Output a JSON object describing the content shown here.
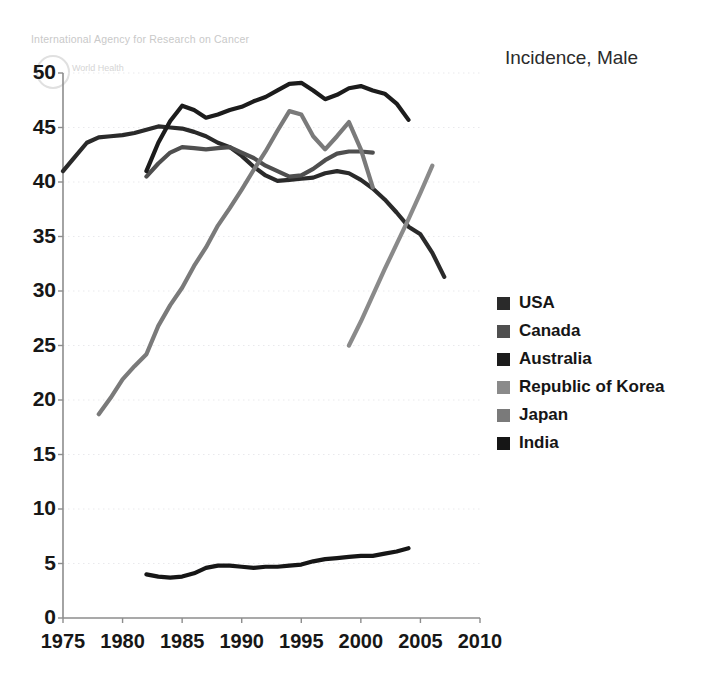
{
  "watermark": {
    "agency": "International Agency for Research on Cancer",
    "org": "World Health"
  },
  "title": "Incidence, Male",
  "legend": {
    "items": [
      {
        "label": "USA",
        "color": "#2a2a2a"
      },
      {
        "label": "Canada",
        "color": "#4f4f4f"
      },
      {
        "label": "Australia",
        "color": "#1c1c1c"
      },
      {
        "label": "Republic of Korea",
        "color": "#8a8a8a"
      },
      {
        "label": "Japan",
        "color": "#7a7a7a"
      },
      {
        "label": "India",
        "color": "#161616"
      }
    ]
  },
  "chart_data": {
    "type": "line",
    "title": "Incidence, Male",
    "xlabel": "",
    "ylabel": "",
    "xlim": [
      1975,
      2010
    ],
    "ylim": [
      0,
      50
    ],
    "xticks": [
      1975,
      1980,
      1985,
      1990,
      1995,
      2000,
      2005,
      2010
    ],
    "yticks": [
      0,
      5,
      10,
      15,
      20,
      25,
      30,
      35,
      40,
      45,
      50
    ],
    "grid": "horizontal-dotted",
    "legend_position": "right",
    "series": [
      {
        "name": "USA",
        "color": "#2a2a2a",
        "x": [
          1975,
          1976,
          1977,
          1978,
          1979,
          1980,
          1981,
          1982,
          1983,
          1984,
          1985,
          1986,
          1987,
          1988,
          1989,
          1990,
          1991,
          1992,
          1993,
          1994,
          1995,
          1996,
          1997,
          1998,
          1999,
          2000,
          2001,
          2002,
          2003,
          2004,
          2005,
          2006,
          2007
        ],
        "y": [
          41.0,
          42.3,
          43.6,
          44.1,
          44.2,
          44.3,
          44.5,
          44.8,
          45.1,
          45.0,
          44.9,
          44.6,
          44.2,
          43.6,
          43.2,
          42.4,
          41.4,
          40.6,
          40.1,
          40.2,
          40.3,
          40.4,
          40.8,
          41.0,
          40.8,
          40.2,
          39.4,
          38.4,
          37.2,
          35.9,
          35.2,
          33.5,
          31.3
        ]
      },
      {
        "name": "Canada",
        "color": "#4f4f4f",
        "x": [
          1982,
          1983,
          1984,
          1985,
          1986,
          1987,
          1988,
          1989,
          1990,
          1991,
          1992,
          1993,
          1994,
          1995,
          1996,
          1997,
          1998,
          1999,
          2000,
          2001
        ],
        "y": [
          40.5,
          41.7,
          42.7,
          43.2,
          43.1,
          43.0,
          43.1,
          43.2,
          42.7,
          42.2,
          41.5,
          41.0,
          40.5,
          40.6,
          41.2,
          42.0,
          42.6,
          42.8,
          42.8,
          42.7
        ]
      },
      {
        "name": "Australia",
        "color": "#1c1c1c",
        "x": [
          1982,
          1983,
          1984,
          1985,
          1986,
          1987,
          1988,
          1989,
          1990,
          1991,
          1992,
          1993,
          1994,
          1995,
          1996,
          1997,
          1998,
          1999,
          2000,
          2001,
          2002,
          2003,
          2004
        ],
        "y": [
          41.0,
          43.6,
          45.6,
          47.0,
          46.6,
          45.9,
          46.2,
          46.6,
          46.9,
          47.4,
          47.8,
          48.4,
          49.0,
          49.1,
          48.4,
          47.6,
          48.0,
          48.6,
          48.8,
          48.4,
          48.1,
          47.2,
          45.7
        ]
      },
      {
        "name": "Republic of Korea",
        "color": "#8a8a8a",
        "x": [
          1999,
          2000,
          2001,
          2002,
          2003,
          2004,
          2005,
          2006
        ],
        "y": [
          25.0,
          27.2,
          29.6,
          32.0,
          34.3,
          36.6,
          39.0,
          41.5
        ]
      },
      {
        "name": "Japan",
        "color": "#7a7a7a",
        "x": [
          1978,
          1979,
          1980,
          1981,
          1982,
          1983,
          1984,
          1985,
          1986,
          1987,
          1988,
          1989,
          1990,
          1991,
          1992,
          1993,
          1994,
          1995,
          1996,
          1997,
          1998,
          1999,
          2000,
          2001
        ],
        "y": [
          18.7,
          20.2,
          21.9,
          23.1,
          24.2,
          26.8,
          28.7,
          30.3,
          32.3,
          34.0,
          36.0,
          37.6,
          39.3,
          41.1,
          42.8,
          44.7,
          46.5,
          46.2,
          44.2,
          43.0,
          44.2,
          45.5,
          43.0,
          39.5
        ]
      },
      {
        "name": "India",
        "color": "#161616",
        "x": [
          1982,
          1983,
          1984,
          1985,
          1986,
          1987,
          1988,
          1989,
          1990,
          1991,
          1992,
          1993,
          1994,
          1995,
          1996,
          1997,
          1998,
          1999,
          2000,
          2001,
          2002,
          2003,
          2004
        ],
        "y": [
          4.0,
          3.8,
          3.7,
          3.8,
          4.1,
          4.6,
          4.8,
          4.8,
          4.7,
          4.6,
          4.7,
          4.7,
          4.8,
          4.9,
          5.2,
          5.4,
          5.5,
          5.6,
          5.7,
          5.7,
          5.9,
          6.1,
          6.4
        ]
      }
    ]
  }
}
